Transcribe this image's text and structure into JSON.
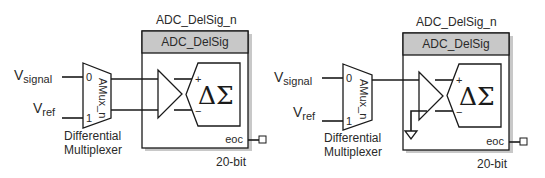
{
  "diagrams": [
    {
      "id": "left",
      "instance_name": "ADC_DelSig_n",
      "component_name": "ADC_DelSig",
      "inputs": [
        {
          "label_main": "V",
          "label_sub": "signal",
          "mux_port": "0"
        },
        {
          "label_main": "V",
          "label_sub": "ref",
          "mux_port": "1"
        }
      ],
      "mux_name": "AMux_n",
      "mux_caption_line1": "Differential",
      "mux_caption_line2": "Multiplexer",
      "modulator_symbol": "ΔΣ",
      "plus_sign": "+",
      "minus_sign": "−",
      "output_pin": "eoc",
      "resolution": "20-bit",
      "mode": "differential"
    },
    {
      "id": "right",
      "instance_name": "ADC_DelSig_n",
      "component_name": "ADC_DelSig",
      "inputs": [
        {
          "label_main": "V",
          "label_sub": "signal",
          "mux_port": "0"
        },
        {
          "label_main": "V",
          "label_sub": "ref",
          "mux_port": "1"
        }
      ],
      "mux_name": "AMux_n",
      "mux_caption_line1": "Differential",
      "mux_caption_line2": "Multiplexer",
      "modulator_symbol": "ΔΣ",
      "plus_sign": "+",
      "minus_sign": "−",
      "output_pin": "eoc",
      "resolution": "20-bit",
      "mode": "single-ended (negative input grounded)"
    }
  ],
  "colors": {
    "header_fill": "#c8c8c8",
    "line": "#1a1a1a",
    "background": "#ffffff"
  }
}
